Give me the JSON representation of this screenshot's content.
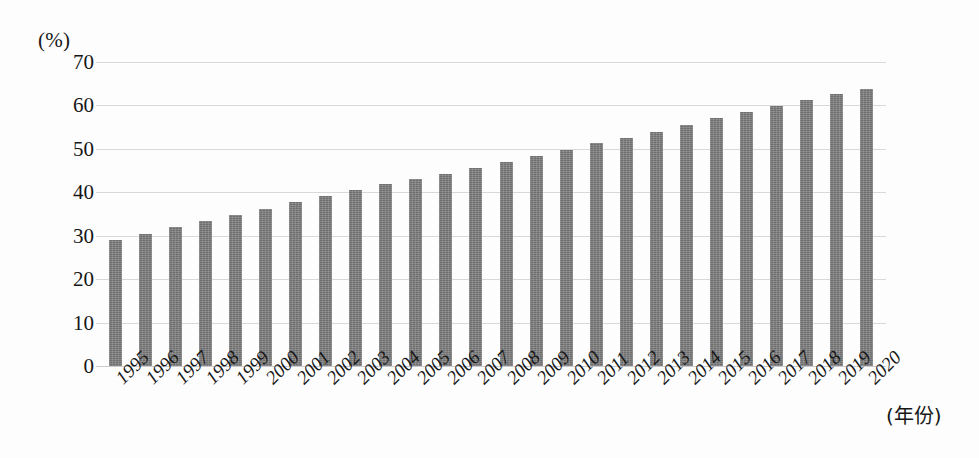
{
  "chart_data": {
    "type": "bar",
    "title": "",
    "subtitle": "",
    "xlabel": "(年份)",
    "ylabel": "(%)",
    "ylim": [
      0,
      70
    ],
    "yticks": [
      70,
      60,
      50,
      40,
      30,
      20,
      10,
      0
    ],
    "grid": true,
    "legend": "none",
    "bar_color": "#6e6e6e",
    "grid_color": "#d9d9dd",
    "categories": [
      "1995",
      "1996",
      "1997",
      "1998",
      "1999",
      "2000",
      "2001",
      "2002",
      "2003",
      "2004",
      "2005",
      "2006",
      "2007",
      "2008",
      "2009",
      "2010",
      "2011",
      "2012",
      "2013",
      "2014",
      "2015",
      "2016",
      "2017",
      "2018",
      "2019",
      "2020"
    ],
    "values": [
      29.0,
      30.5,
      31.9,
      33.4,
      34.8,
      36.2,
      37.7,
      39.1,
      40.5,
      41.8,
      43.0,
      44.3,
      45.7,
      46.9,
      48.3,
      49.7,
      51.3,
      52.6,
      54.0,
      55.5,
      57.0,
      58.5,
      59.9,
      61.2,
      62.7,
      63.9
    ]
  }
}
